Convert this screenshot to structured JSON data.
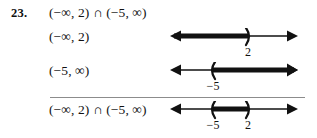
{
  "exercise": {
    "number": "23.",
    "main_expression": "(−∞, 2) ∩ (−5, ∞)"
  },
  "rows": [
    {
      "label": "(−∞, 2)",
      "ticks": [
        {
          "text": "2",
          "x": 80
        }
      ],
      "line": {
        "left_arrow": true,
        "right_arrow": true,
        "shaded_from": "left-arrow",
        "shaded_to": 80,
        "parens": [
          {
            "glyph": ")",
            "x": 80,
            "value": "2"
          }
        ]
      }
    },
    {
      "label": "(−5, ∞)",
      "ticks": [
        {
          "text": "−5",
          "x": 45
        }
      ],
      "line": {
        "left_arrow": true,
        "right_arrow": true,
        "shaded_from": 45,
        "shaded_to": "right-arrow",
        "parens": [
          {
            "glyph": "(",
            "x": 45,
            "value": "−5"
          }
        ]
      }
    },
    {
      "label": "(−∞, 2) ∩ (−5, ∞)",
      "ticks": [
        {
          "text": "−5",
          "x": 45
        },
        {
          "text": "2",
          "x": 80
        }
      ],
      "line": {
        "left_arrow": true,
        "right_arrow": true,
        "shaded_from": 45,
        "shaded_to": 80,
        "parens": [
          {
            "glyph": "(",
            "x": 45,
            "value": "−5"
          },
          {
            "glyph": ")",
            "x": 80,
            "value": "2"
          }
        ]
      }
    }
  ],
  "colors": {
    "ink": "#111111",
    "rule": "#8c8c8c",
    "background": "#ffffff"
  }
}
